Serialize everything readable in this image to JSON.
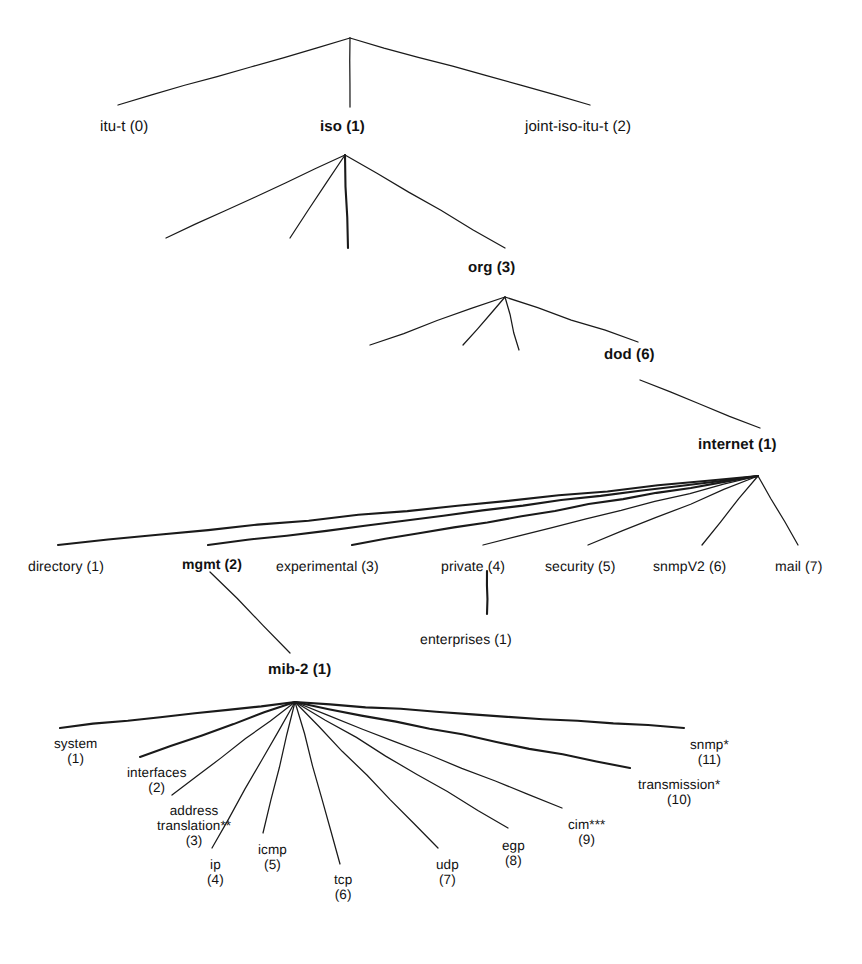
{
  "diagram": {
    "type": "tree",
    "background_color": "#ffffff",
    "line_color": "#1a1a1a",
    "text_color": "#111111",
    "width": 862,
    "height": 964
  },
  "nodes": {
    "root": {
      "label": "",
      "x": 350,
      "y": 38,
      "bold": false,
      "visible": false
    },
    "itu_t": {
      "label": "itu-t (0)",
      "number": "0",
      "name": "itu-t",
      "x": 100,
      "y": 119,
      "bold": false
    },
    "iso": {
      "label": "iso (1)",
      "number": "1",
      "name": "iso",
      "x": 320,
      "y": 119,
      "bold": true
    },
    "joint": {
      "label": "joint-iso-itu-t (2)",
      "number": "2",
      "name": "joint-iso-itu-t",
      "x": 525,
      "y": 119,
      "bold": false
    },
    "org": {
      "label": "org (3)",
      "number": "3",
      "name": "org",
      "x": 468,
      "y": 260,
      "bold": true
    },
    "dod": {
      "label": "dod (6)",
      "number": "6",
      "name": "dod",
      "x": 604,
      "y": 347,
      "bold": true
    },
    "internet": {
      "label": "internet (1)",
      "number": "1",
      "name": "internet",
      "x": 698,
      "y": 437,
      "bold": true
    },
    "enterprises": {
      "label": "enterprises (1)",
      "number": "1",
      "name": "enterprises",
      "x": 420,
      "y": 632,
      "bold": false
    },
    "mib2": {
      "label": "mib-2 (1)",
      "number": "1",
      "name": "mib-2",
      "x": 268,
      "y": 662,
      "bold": true
    }
  },
  "internet_children": [
    {
      "label": "directory (1)",
      "name": "directory",
      "number": "1",
      "x": 28,
      "y": 559,
      "bold": false
    },
    {
      "label": "mgmt (2)",
      "name": "mgmt",
      "number": "2",
      "x": 182,
      "y": 557,
      "bold": true
    },
    {
      "label": "experimental (3)",
      "name": "experimental",
      "number": "3",
      "x": 276,
      "y": 559,
      "bold": false
    },
    {
      "label": "private (4)",
      "name": "private",
      "number": "4",
      "x": 441,
      "y": 559,
      "bold": false
    },
    {
      "label": "security (5)",
      "name": "security",
      "number": "5",
      "x": 545,
      "y": 559,
      "bold": false
    },
    {
      "label": "snmpV2 (6)",
      "name": "snmpV2",
      "number": "6",
      "x": 653,
      "y": 559,
      "bold": false
    },
    {
      "label": "mail (7)",
      "name": "mail",
      "number": "7",
      "x": 775,
      "y": 559,
      "bold": false
    }
  ],
  "mib2_children": [
    {
      "name": "system",
      "line1": "system",
      "line2": "(1)",
      "number": "1",
      "x": 54,
      "y": 736
    },
    {
      "name": "interfaces",
      "line1": "interfaces",
      "line2": "(2)",
      "number": "2",
      "x": 127,
      "y": 765
    },
    {
      "name": "address-translation",
      "line1": "address",
      "line1b": "translation**",
      "line2": "(3)",
      "number": "3",
      "x": 157,
      "y": 803
    },
    {
      "name": "ip",
      "line1": "ip",
      "line2": "(4)",
      "number": "4",
      "x": 207,
      "y": 857
    },
    {
      "name": "icmp",
      "line1": "icmp",
      "line2": "(5)",
      "number": "5",
      "x": 258,
      "y": 842
    },
    {
      "name": "tcp",
      "line1": "tcp",
      "line2": "(6)",
      "number": "6",
      "x": 334,
      "y": 872
    },
    {
      "name": "udp",
      "line1": "udp",
      "line2": "(7)",
      "number": "7",
      "x": 436,
      "y": 857
    },
    {
      "name": "egp",
      "line1": "egp",
      "line2": "(8)",
      "number": "8",
      "x": 502,
      "y": 838
    },
    {
      "name": "cim",
      "line1": "cim***",
      "line2": "(9)",
      "number": "9",
      "x": 568,
      "y": 817
    },
    {
      "name": "transmission",
      "line1": "transmission*",
      "line2": "(10)",
      "number": "10",
      "x": 638,
      "y": 777
    },
    {
      "name": "snmp",
      "line1": "snmp*",
      "line2": "(11)",
      "number": "11",
      "x": 690,
      "y": 737
    }
  ],
  "edges": [
    {
      "from": "root",
      "to": "itu-t",
      "x1": 350,
      "y1": 38,
      "x2": 118,
      "y2": 105,
      "thick": false
    },
    {
      "from": "root",
      "to": "iso",
      "x1": 350,
      "y1": 38,
      "x2": 350,
      "y2": 107,
      "thick": false
    },
    {
      "from": "root",
      "to": "joint-iso-itu-t",
      "x1": 350,
      "y1": 38,
      "x2": 590,
      "y2": 105,
      "thick": false
    },
    {
      "from": "iso",
      "to": "unlabeled-a",
      "x1": 345,
      "y1": 155,
      "x2": 166,
      "y2": 238,
      "thick": false
    },
    {
      "from": "iso",
      "to": "unlabeled-b",
      "x1": 345,
      "y1": 155,
      "x2": 290,
      "y2": 238,
      "thick": false
    },
    {
      "from": "iso",
      "to": "unlabeled-c",
      "x1": 345,
      "y1": 155,
      "x2": 348,
      "y2": 248,
      "thick": true
    },
    {
      "from": "iso",
      "to": "org",
      "x1": 345,
      "y1": 155,
      "x2": 505,
      "y2": 248,
      "thick": false
    },
    {
      "from": "org",
      "to": "unlabeled-d",
      "x1": 505,
      "y1": 297,
      "x2": 370,
      "y2": 345,
      "thick": false
    },
    {
      "from": "org",
      "to": "unlabeled-e",
      "x1": 505,
      "y1": 297,
      "x2": 463,
      "y2": 345,
      "thick": false
    },
    {
      "from": "org",
      "to": "unlabeled-f",
      "x1": 505,
      "y1": 297,
      "x2": 519,
      "y2": 350,
      "thick": false
    },
    {
      "from": "org",
      "to": "dod",
      "x1": 505,
      "y1": 297,
      "x2": 638,
      "y2": 342,
      "thick": false
    },
    {
      "from": "dod",
      "to": "internet",
      "x1": 640,
      "y1": 380,
      "x2": 760,
      "y2": 428,
      "thick": false
    },
    {
      "from": "internet",
      "to": "directory",
      "x1": 758,
      "y1": 476,
      "x2": 58,
      "y2": 545,
      "thick": true
    },
    {
      "from": "internet",
      "to": "mgmt",
      "x1": 758,
      "y1": 476,
      "x2": 208,
      "y2": 545,
      "thick": true
    },
    {
      "from": "internet",
      "to": "experimental",
      "x1": 758,
      "y1": 476,
      "x2": 352,
      "y2": 545,
      "thick": true
    },
    {
      "from": "internet",
      "to": "private",
      "x1": 758,
      "y1": 476,
      "x2": 483,
      "y2": 545,
      "thick": false
    },
    {
      "from": "internet",
      "to": "security",
      "x1": 758,
      "y1": 476,
      "x2": 588,
      "y2": 545,
      "thick": false
    },
    {
      "from": "internet",
      "to": "snmpV2",
      "x1": 758,
      "y1": 476,
      "x2": 702,
      "y2": 545,
      "thick": false
    },
    {
      "from": "internet",
      "to": "mail",
      "x1": 758,
      "y1": 476,
      "x2": 798,
      "y2": 545,
      "thick": false
    },
    {
      "from": "mgmt",
      "to": "mib-2",
      "x1": 210,
      "y1": 572,
      "x2": 290,
      "y2": 653,
      "thick": false
    },
    {
      "from": "private",
      "to": "enterprises",
      "x1": 487,
      "y1": 571,
      "x2": 487,
      "y2": 614,
      "thick": true
    },
    {
      "from": "mib-2",
      "to": "system",
      "x1": 295,
      "y1": 702,
      "x2": 60,
      "y2": 728,
      "thick": true
    },
    {
      "from": "mib-2",
      "to": "interfaces",
      "x1": 295,
      "y1": 702,
      "x2": 140,
      "y2": 757,
      "thick": true
    },
    {
      "from": "mib-2",
      "to": "address-translation",
      "x1": 295,
      "y1": 702,
      "x2": 172,
      "y2": 795,
      "thick": false
    },
    {
      "from": "mib-2",
      "to": "ip",
      "x1": 295,
      "y1": 702,
      "x2": 212,
      "y2": 848,
      "thick": false
    },
    {
      "from": "mib-2",
      "to": "icmp",
      "x1": 295,
      "y1": 702,
      "x2": 263,
      "y2": 833,
      "thick": false
    },
    {
      "from": "mib-2",
      "to": "tcp",
      "x1": 295,
      "y1": 702,
      "x2": 340,
      "y2": 864,
      "thick": false
    },
    {
      "from": "mib-2",
      "to": "udp",
      "x1": 295,
      "y1": 702,
      "x2": 438,
      "y2": 848,
      "thick": false
    },
    {
      "from": "mib-2",
      "to": "egp",
      "x1": 295,
      "y1": 702,
      "x2": 508,
      "y2": 828,
      "thick": false
    },
    {
      "from": "mib-2",
      "to": "cim",
      "x1": 295,
      "y1": 702,
      "x2": 562,
      "y2": 808,
      "thick": false
    },
    {
      "from": "mib-2",
      "to": "transmission",
      "x1": 295,
      "y1": 702,
      "x2": 630,
      "y2": 768,
      "thick": true
    },
    {
      "from": "mib-2",
      "to": "snmp",
      "x1": 295,
      "y1": 702,
      "x2": 684,
      "y2": 728,
      "thick": true
    }
  ]
}
